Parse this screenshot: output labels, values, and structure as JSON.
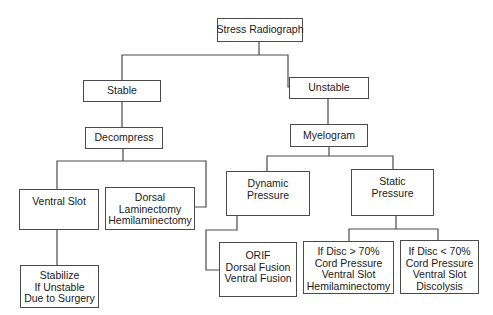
{
  "diagram": {
    "type": "flowchart",
    "nodes": {
      "root": {
        "lines": [
          "Stress Radiograph"
        ]
      },
      "stable": {
        "lines": [
          "Stable"
        ]
      },
      "unstable": {
        "lines": [
          "Unstable"
        ]
      },
      "decompress": {
        "lines": [
          "Decompress"
        ]
      },
      "myelogram": {
        "lines": [
          "Myelogram"
        ]
      },
      "ventral_slot": {
        "lines": [
          "Ventral Slot"
        ]
      },
      "dorsal": {
        "lines": [
          "Dorsal",
          "Laminectomy",
          "Hemilaminectomy"
        ]
      },
      "stabilize": {
        "lines": [
          "Stabilize",
          "If Unstable",
          "Due to Surgery"
        ]
      },
      "dynamic": {
        "lines": [
          "Dynamic",
          "Pressure"
        ]
      },
      "static": {
        "lines": [
          "Static",
          "Pressure"
        ]
      },
      "orif": {
        "lines": [
          "ORIF",
          "Dorsal Fusion",
          "Ventral Fusion"
        ]
      },
      "disc_gt70": {
        "lines": [
          "If Disc > 70%",
          "Cord Pressure",
          "Ventral Slot",
          "Hemilaminectomy"
        ]
      },
      "disc_lt70": {
        "lines": [
          "If Disc < 70%",
          "Cord Pressure",
          "Ventral Slot",
          "Discolysis"
        ]
      }
    },
    "edges": [
      [
        "root",
        "stable"
      ],
      [
        "root",
        "unstable"
      ],
      [
        "stable",
        "decompress"
      ],
      [
        "unstable",
        "myelogram"
      ],
      [
        "decompress",
        "ventral_slot"
      ],
      [
        "decompress",
        "dorsal"
      ],
      [
        "ventral_slot",
        "stabilize"
      ],
      [
        "myelogram",
        "dynamic"
      ],
      [
        "myelogram",
        "static"
      ],
      [
        "dynamic",
        "orif"
      ],
      [
        "static",
        "disc_gt70"
      ],
      [
        "static",
        "disc_lt70"
      ]
    ],
    "colors": {
      "line": "#4a4a4a",
      "text": "#1a1a1a",
      "background": "#ffffff"
    }
  }
}
